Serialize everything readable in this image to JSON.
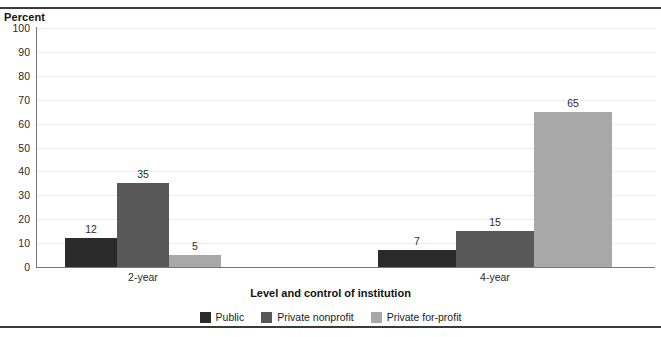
{
  "chart_data": {
    "type": "bar",
    "title": "",
    "xlabel": "Level and control of institution",
    "ylabel": "Percent",
    "ylim": [
      0,
      100
    ],
    "yticks": [
      0,
      10,
      20,
      30,
      40,
      50,
      60,
      70,
      80,
      90,
      100
    ],
    "grid": true,
    "legend_position": "bottom",
    "categories": [
      "2-year",
      "4-year"
    ],
    "series": [
      {
        "name": "Public",
        "color": "#2b2b2b",
        "values": [
          12,
          7
        ]
      },
      {
        "name": "Private nonprofit",
        "color": "#585858",
        "values": [
          35,
          15
        ]
      },
      {
        "name": "Private for-profit",
        "color": "#a8a8a8",
        "values": [
          5,
          65
        ]
      }
    ]
  },
  "axes": {
    "y_title": "Percent",
    "x_title": "Level and control of institution",
    "y_tick_labels": [
      "100",
      "90",
      "80",
      "70",
      "60",
      "50",
      "40",
      "30",
      "20",
      "10",
      "0"
    ]
  },
  "groups": [
    {
      "label": "2-year",
      "bars": [
        {
          "series": "Public",
          "value_label": "12"
        },
        {
          "series": "Private nonprofit",
          "value_label": "35"
        },
        {
          "series": "Private for-profit",
          "value_label": "5"
        }
      ]
    },
    {
      "label": "4-year",
      "bars": [
        {
          "series": "Public",
          "value_label": "7"
        },
        {
          "series": "Private nonprofit",
          "value_label": "15"
        },
        {
          "series": "Private for-profit",
          "value_label": "65"
        }
      ]
    }
  ],
  "legend": {
    "items": [
      {
        "label": "Public",
        "color": "#2b2b2b"
      },
      {
        "label": "Private nonprofit",
        "color": "#585858"
      },
      {
        "label": "Private for-profit",
        "color": "#a8a8a8"
      }
    ]
  },
  "clipped": {
    "top_text": "",
    "bottom_text": ""
  }
}
